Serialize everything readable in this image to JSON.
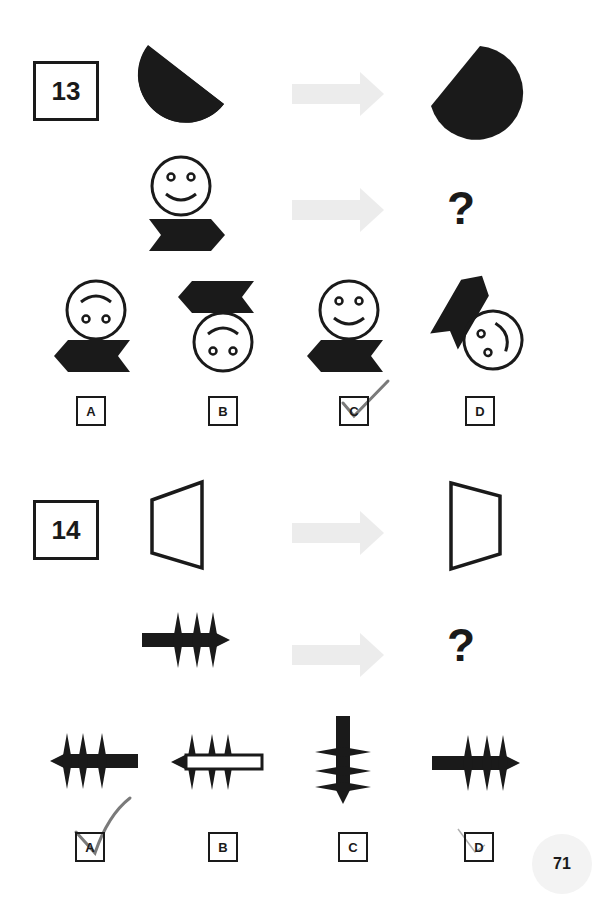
{
  "questions": [
    {
      "number": "13",
      "prompt_row_1": {
        "left": "half-circle (rounded left, diagonal cut upper-right)",
        "right": "half-circle mirrored (rounded right, diagonal cut lower-left)"
      },
      "prompt_row_2": {
        "left": "smiley face above right-pointing chevron flag",
        "right": "?"
      },
      "options": [
        {
          "label": "A",
          "figure": "upside-down face above left-pointing chevron",
          "marked": false
        },
        {
          "label": "B",
          "figure": "left-pointing chevron above upside-down face",
          "marked": false
        },
        {
          "label": "C",
          "figure": "smiley face above left-pointing chevron",
          "marked": true
        },
        {
          "label": "D",
          "figure": "rotated face with tilted chevron",
          "marked": false
        }
      ]
    },
    {
      "number": "14",
      "prompt_row_1": {
        "left": "trapezoid wide on right",
        "right": "trapezoid wide on left"
      },
      "prompt_row_2": {
        "left": "bar with three spikes pointing right",
        "right": "?"
      },
      "options": [
        {
          "label": "A",
          "figure": "bar with spikes pointing left",
          "marked": true
        },
        {
          "label": "B",
          "figure": "hollow bar with spikes pointing left",
          "marked": false
        },
        {
          "label": "C",
          "figure": "vertical bar with spikes pointing down",
          "marked": false
        },
        {
          "label": "D",
          "figure": "bar with spikes pointing right",
          "marked": false
        }
      ]
    }
  ],
  "question_mark": "?",
  "page_number": "71",
  "colors": {
    "ink": "#1a1a1a",
    "arrow": "#ececec",
    "checkmark": "#7a7a7a",
    "page_badge": "#f3f3f3"
  }
}
